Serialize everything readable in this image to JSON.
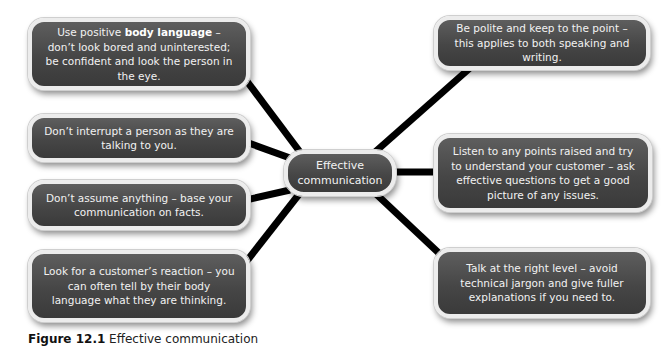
{
  "diagram": {
    "center": {
      "label": "Effective communication",
      "line1": "Effective",
      "line2": "communication"
    },
    "nodes": {
      "left": [
        {
          "pre": "Use positive ",
          "bold": "body language",
          "post": " – don’t look bored and uninterested; be confident and look the person in the eye."
        },
        {
          "text": "Don’t interrupt a person as they are talking to you."
        },
        {
          "text": "Don’t assume anything – base your communication on facts."
        },
        {
          "text": "Look for a customer’s reaction – you can often tell by their body language what they are thinking."
        }
      ],
      "right": [
        {
          "text": "Be polite and keep to the point – this applies to both speaking and writing."
        },
        {
          "text": "Listen to any points raised and try to understand your customer – ask effective questions to get a good picture of any issues."
        },
        {
          "text": "Talk at the right level – avoid technical jargon and give fuller explanations if you need to."
        }
      ]
    },
    "colors": {
      "box_fill": "#4a4a4a",
      "box_border": "#ececec",
      "connector": "#000000",
      "text": "#f2f2f2"
    }
  },
  "caption": {
    "label": "Figure 12.1",
    "text": " Effective communication"
  }
}
